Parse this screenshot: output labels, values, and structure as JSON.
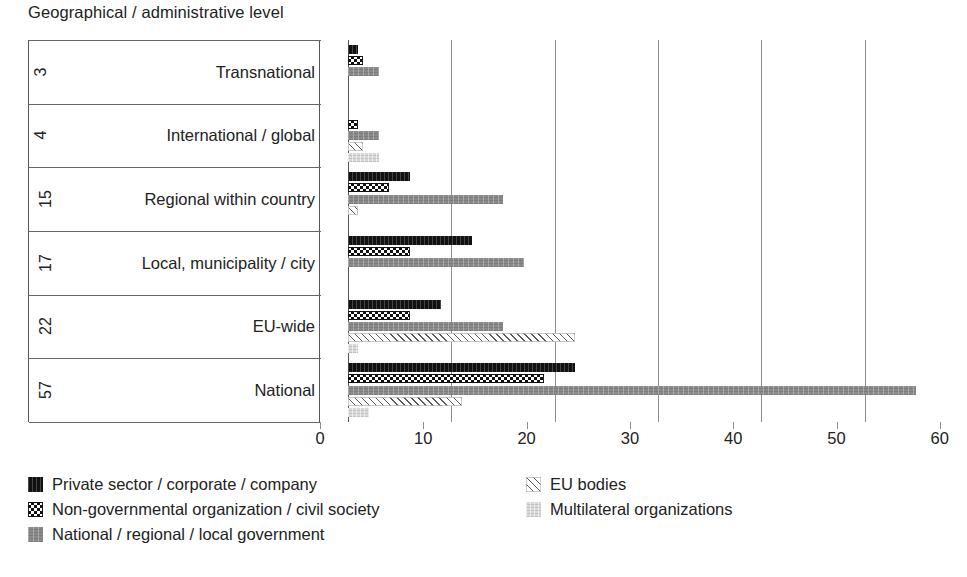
{
  "chart_data": {
    "type": "bar",
    "orientation": "horizontal",
    "title": "Geographical / administrative level",
    "xlabel": "",
    "ylabel": "",
    "xlim": [
      0,
      60
    ],
    "xticks": [
      0,
      10,
      20,
      30,
      40,
      50,
      60
    ],
    "xtick_labels": [
      "0",
      "10",
      "20",
      "30",
      "40",
      "50",
      "60"
    ],
    "grid": true,
    "legend_position": "bottom",
    "categories": [
      "Transnational",
      "International / global",
      "Regional within country",
      "Local, municipality / city",
      "EU-wide",
      "National"
    ],
    "category_counts": [
      "3",
      "4",
      "15",
      "17",
      "22",
      "57"
    ],
    "series": [
      {
        "name": "Private sector / corporate / company",
        "pattern": "solid-black",
        "color": "#111111",
        "values": [
          1,
          0,
          6,
          12,
          9,
          22
        ]
      },
      {
        "name": "Non-governmental organization / civil society",
        "pattern": "checker",
        "color": "#111111",
        "values": [
          1.5,
          1,
          4,
          6,
          6,
          19
        ]
      },
      {
        "name": "National / regional / local government",
        "pattern": "solid-gray",
        "color": "#8a8a8a",
        "values": [
          3,
          3,
          15,
          17,
          15,
          55
        ]
      },
      {
        "name": "EU bodies",
        "pattern": "hatch",
        "color": "#5a5a5a",
        "values": [
          0,
          1.5,
          1,
          0,
          22,
          11
        ]
      },
      {
        "name": "Multilateral organizations",
        "pattern": "light-gray",
        "color": "#d9d9d9",
        "values": [
          0,
          3,
          0,
          0,
          1,
          2
        ]
      }
    ]
  },
  "legend": {
    "left_column": [
      "Private sector / corporate / company",
      "Non-governmental organization / civil society",
      "National / regional / local government"
    ],
    "right_column": [
      "EU bodies",
      "Multilateral organizations"
    ]
  }
}
